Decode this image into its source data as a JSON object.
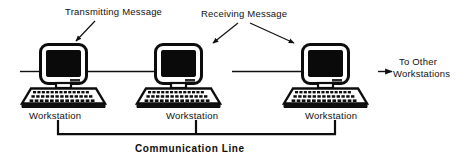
{
  "diagram": {
    "annotations": {
      "transmitting": "Transmitting  Message",
      "receiving": "Receiving  Message",
      "to_other_line1": "To  Other",
      "to_other_line2": "Workstations",
      "communication_line": "Communication  Line"
    },
    "nodes": [
      {
        "id": "ws1",
        "label": "Workstation",
        "role": "transmitting"
      },
      {
        "id": "ws2",
        "label": "Workstation",
        "role": "receiving"
      },
      {
        "id": "ws3",
        "label": "Workstation",
        "role": "receiving"
      }
    ],
    "colors": {
      "ink": "#0d0d0d",
      "screen": "#0a0a0a",
      "paper": "#ffffff"
    }
  }
}
